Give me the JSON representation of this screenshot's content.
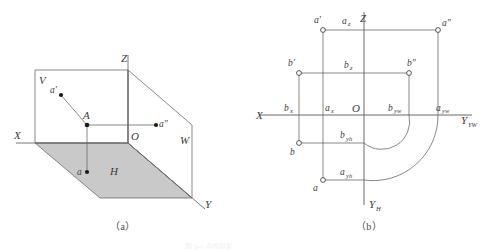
{
  "figure": {
    "title_faint": "图 3-4 点的投影",
    "panels": [
      {
        "id": "a",
        "caption": "（a）",
        "type": "pictorial-projection-planes",
        "description": "Axonometric view of the three mutually perpendicular projection planes V, H, W with point A and its projections",
        "axes": [
          {
            "name": "X",
            "label": "X"
          },
          {
            "name": "Y",
            "label": "Y"
          },
          {
            "name": "Z",
            "label": "Z"
          }
        ],
        "origin_label": "O",
        "planes": [
          {
            "name": "V",
            "label": "V",
            "shaded": false,
            "fill": "#ffffff"
          },
          {
            "name": "H",
            "label": "H",
            "shaded": true,
            "fill": "#c9c9c9"
          },
          {
            "name": "W",
            "label": "W",
            "shaded": false,
            "fill": "#ffffff"
          }
        ],
        "points": [
          {
            "name": "A",
            "label": "A",
            "kind": "space-point"
          },
          {
            "name": "a-prime",
            "label": "a′",
            "kind": "V-projection"
          },
          {
            "name": "a-double-prime",
            "label": "a″",
            "kind": "W-projection"
          },
          {
            "name": "a",
            "label": "a",
            "kind": "H-projection"
          }
        ]
      },
      {
        "id": "b",
        "caption": "（b）",
        "type": "orthographic-unfolded",
        "description": "Unfolded two-dimensional projection drawing with X, Y_H, Y_YW and Z axes, points a, a', a'', b, b', b'' and construction arcs",
        "axes": [
          {
            "name": "X",
            "label": "X"
          },
          {
            "name": "Z",
            "label": "Z"
          },
          {
            "name": "Y-YW",
            "label": "Y",
            "sub": "YW"
          },
          {
            "name": "Y-H",
            "label": "Y",
            "sub": "H"
          }
        ],
        "origin_label": "O",
        "points": [
          {
            "name": "a-prime",
            "label": "a′"
          },
          {
            "name": "a-double-prime",
            "label": "a″"
          },
          {
            "name": "a",
            "label": "a"
          },
          {
            "name": "b-prime",
            "label": "b′"
          },
          {
            "name": "b-double-prime",
            "label": "b″"
          },
          {
            "name": "b",
            "label": "b"
          }
        ],
        "axis_marks": [
          {
            "name": "az",
            "label": "a",
            "sub": "z"
          },
          {
            "name": "bz",
            "label": "b",
            "sub": "z"
          },
          {
            "name": "bx",
            "label": "b",
            "sub": "x"
          },
          {
            "name": "ax",
            "label": "a",
            "sub": "x"
          },
          {
            "name": "byw",
            "label": "b",
            "sub": "yw"
          },
          {
            "name": "ayw",
            "label": "a",
            "sub": "yw"
          },
          {
            "name": "byh",
            "label": "b",
            "sub": "yh"
          },
          {
            "name": "ayh",
            "label": "a",
            "sub": "yh"
          }
        ],
        "arcs": [
          {
            "name": "arc-b",
            "from": "b-yh",
            "to": "b-yw",
            "center": "O"
          },
          {
            "name": "arc-a",
            "from": "a-yh",
            "to": "a-yw",
            "center": "O"
          }
        ]
      }
    ]
  },
  "colors": {
    "line": "#555555",
    "axis": "#4a4a4a",
    "h_plane_fill": "#c9c9c9",
    "point_fill": "#1a1a1a",
    "hollow_stroke": "#444444",
    "background": "#ffffff"
  }
}
